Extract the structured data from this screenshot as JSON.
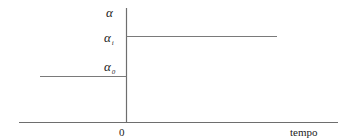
{
  "diagram": {
    "type": "step-function",
    "y_axis_label": "α",
    "levels": [
      {
        "symbol": "α",
        "subscript": "i",
        "region": "t > 0"
      },
      {
        "symbol": "α",
        "subscript": "0",
        "region": "t < 0"
      }
    ],
    "x_axis_label": "tempo",
    "origin_label": "0",
    "line_color": "#7a7a7a"
  },
  "labels": {
    "alpha": "α",
    "alpha_i_base": "α",
    "alpha_i_sub": "i",
    "alpha_0_base": "α",
    "alpha_0_sub": "0",
    "zero": "0",
    "tempo": "tempo"
  }
}
